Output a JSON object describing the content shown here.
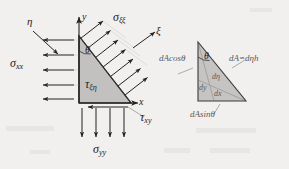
{
  "figure": {
    "background_color": "#f2f0ee",
    "ink_color": "#232323",
    "fill_color": "#bfbfbf",
    "faint_color": "#9a9a9a"
  },
  "axes": {
    "y_label": "y",
    "x_label": "x",
    "xi_label": "ξ",
    "eta_label": "η"
  },
  "left_element": {
    "theta_label": "θ",
    "stress_x": {
      "symbol": "σ",
      "subscript": "xx",
      "arrow_count": 4,
      "direction": "left"
    },
    "stress_y": {
      "symbol": "σ",
      "subscript": "yy",
      "arrow_count": 4,
      "direction": "down"
    },
    "stress_xi": {
      "symbol": "σ",
      "subscript": "ξξ",
      "arrow_count": 6,
      "direction": "normal-outward"
    },
    "shear_xi_eta": {
      "symbol": "τ",
      "subscript": "ξη"
    },
    "shear_xy": {
      "symbol": "τ",
      "subscript": "xy",
      "direction": "left"
    }
  },
  "right_element": {
    "theta_label": "θ",
    "side_left": "dAcosθ",
    "side_hyp": "dA=dηh",
    "side_bottom": "dAsinθ",
    "inner_eta": "dη",
    "inner_y": "dy",
    "inner_x": "dx"
  }
}
